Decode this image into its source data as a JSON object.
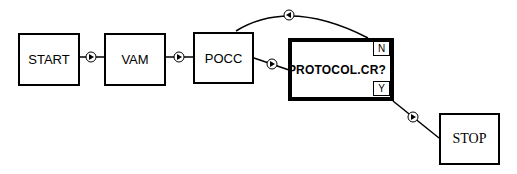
{
  "diagram": {
    "nodes": [
      {
        "id": "start",
        "label": "START",
        "type": "process"
      },
      {
        "id": "vam",
        "label": "VAM",
        "type": "process"
      },
      {
        "id": "pocc",
        "label": "POCC",
        "type": "process"
      },
      {
        "id": "decision",
        "label": "PROTOCOL.CR?",
        "type": "decision",
        "branches": {
          "no": "N",
          "yes": "Y"
        }
      },
      {
        "id": "stop",
        "label": "STOP",
        "type": "process"
      }
    ],
    "edges": [
      {
        "from": "start",
        "to": "vam",
        "marker": "right-arrow"
      },
      {
        "from": "vam",
        "to": "pocc",
        "marker": "right-arrow"
      },
      {
        "from": "pocc",
        "to": "decision",
        "marker": "right-arrow"
      },
      {
        "from": "decision",
        "to": "pocc",
        "branch": "N",
        "marker": "left-arrow",
        "style": "arc"
      },
      {
        "from": "decision",
        "to": "stop",
        "branch": "Y",
        "marker": "right-arrow"
      }
    ]
  }
}
